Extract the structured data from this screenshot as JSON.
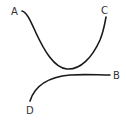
{
  "diagram": {
    "colors": {
      "curve": "#1a1a1a",
      "label": "#333333",
      "background": "#ffffff"
    },
    "labels": {
      "a": "A",
      "b": "B",
      "c": "C",
      "d": "D"
    },
    "curves": [
      {
        "name": "curve-a-to-c",
        "from": "A",
        "to": "C",
        "shape": "U-shaped"
      },
      {
        "name": "curve-d-to-b",
        "from": "D",
        "to": "B",
        "shape": "rising then leveling"
      }
    ]
  }
}
